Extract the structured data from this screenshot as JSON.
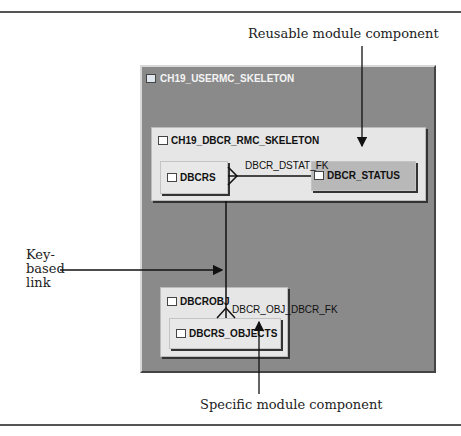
{
  "callouts": {
    "reusable": "Reusable module component",
    "key_based_line1": "Key-",
    "key_based_line2": "based",
    "key_based_line3": "link",
    "specific": "Specific module component"
  },
  "diagram": {
    "outer_module": {
      "name": "CH19_USERMC_SKELETON",
      "icon": "module-icon"
    },
    "reusable_module": {
      "name": "CH19_DBCR_RMC_SKELETON",
      "icon": "reusable-module-icon",
      "tables": [
        {
          "name": "DBCRS",
          "icon": "table-icon"
        },
        {
          "name": "DBCR_STATUS",
          "icon": "table-shortcut-icon"
        }
      ]
    },
    "specific_module": {
      "name": "DBCROBJ",
      "icon": "module-icon",
      "tables": [
        {
          "name": "DBCRS_OBJECTS",
          "icon": "table-icon"
        }
      ]
    },
    "links": [
      {
        "name": "DBCR_DSTAT_FK",
        "from": "DBCRS",
        "to": "DBCR_STATUS"
      },
      {
        "name": "DBCR_OBJ_DBCR_FK",
        "from": "DBCRS_OBJECTS",
        "to": "DBCRS"
      }
    ]
  },
  "colors": {
    "panel": "#8a8a8a",
    "box": "#e6e6e6",
    "shortcut_box": "#b8b8b8"
  }
}
